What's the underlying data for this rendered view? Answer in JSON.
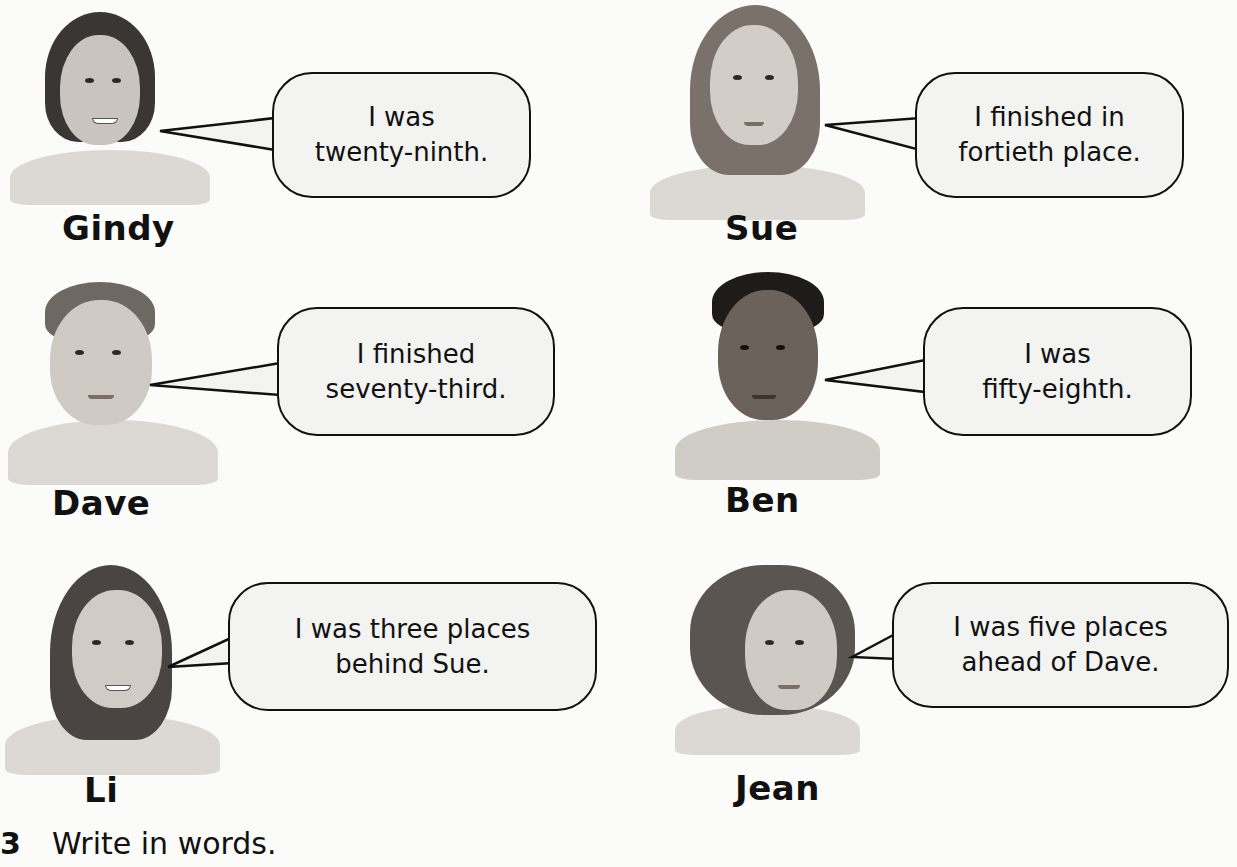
{
  "characters": [
    {
      "name": "Gindy",
      "speech_line1": "I was",
      "speech_line2": "twenty-ninth."
    },
    {
      "name": "Sue",
      "speech_line1": "I finished in",
      "speech_line2": "fortieth place."
    },
    {
      "name": "Dave",
      "speech_line1": "I finished",
      "speech_line2": "seventy-third."
    },
    {
      "name": "Ben",
      "speech_line1": "I was",
      "speech_line2": "fifty-eighth."
    },
    {
      "name": "Li",
      "speech_line1": "I was three places",
      "speech_line2": "behind Sue."
    },
    {
      "name": "Jean",
      "speech_line1": "I was five places",
      "speech_line2": "ahead of Dave."
    }
  ],
  "question": {
    "number": "3",
    "text": "Write in words."
  }
}
